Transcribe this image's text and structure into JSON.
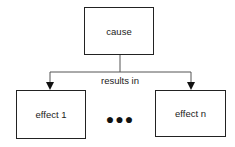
{
  "diagram": {
    "cause": {
      "label": "cause"
    },
    "relation": {
      "label": "results in"
    },
    "effects": [
      {
        "label": "effect 1"
      },
      {
        "label": "effect n"
      }
    ],
    "ellipsis": "●●●"
  }
}
